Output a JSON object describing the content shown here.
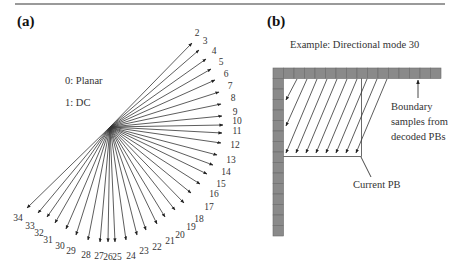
{
  "panel_a": {
    "label": "(a)",
    "legend": [
      "0: Planar",
      "1: DC"
    ],
    "center": [
      110,
      127
    ],
    "modes": [
      {
        "id": "2",
        "end": [
          192,
          43
        ],
        "lab": [
          197,
          34
        ]
      },
      {
        "id": "3",
        "end": [
          199,
          50
        ],
        "lab": [
          205,
          42
        ]
      },
      {
        "id": "4",
        "end": [
          206,
          59
        ],
        "lab": [
          214,
          52
        ]
      },
      {
        "id": "5",
        "end": [
          211,
          69
        ],
        "lab": [
          221,
          63
        ]
      },
      {
        "id": "6",
        "end": [
          215,
          80
        ],
        "lab": [
          226,
          75
        ]
      },
      {
        "id": "7",
        "end": [
          219,
          92
        ],
        "lab": [
          230,
          87
        ]
      },
      {
        "id": "8",
        "end": [
          221,
          104
        ],
        "lab": [
          233,
          99
        ]
      },
      {
        "id": "9",
        "end": [
          222,
          116
        ],
        "lab": [
          235,
          113
        ]
      },
      {
        "id": "10",
        "end": [
          223,
          125
        ],
        "lab": [
          237,
          122
        ]
      },
      {
        "id": "11",
        "end": [
          222,
          133
        ],
        "lab": [
          237,
          132
        ]
      },
      {
        "id": "12",
        "end": [
          221,
          143
        ],
        "lab": [
          235,
          146
        ]
      },
      {
        "id": "13",
        "end": [
          217,
          155
        ],
        "lab": [
          231,
          161
        ]
      },
      {
        "id": "14",
        "end": [
          213,
          165
        ],
        "lab": [
          226,
          173
        ]
      },
      {
        "id": "15",
        "end": [
          207,
          174
        ],
        "lab": [
          221,
          185
        ]
      },
      {
        "id": "16",
        "end": [
          200,
          184
        ],
        "lab": [
          214,
          195
        ]
      },
      {
        "id": "17",
        "end": [
          191,
          193
        ],
        "lab": [
          209,
          208
        ]
      },
      {
        "id": "18",
        "end": [
          184,
          203
        ],
        "lab": [
          199,
          220
        ]
      },
      {
        "id": "19",
        "end": [
          175,
          210
        ],
        "lab": [
          191,
          228
        ]
      },
      {
        "id": "20",
        "end": [
          165,
          217
        ],
        "lab": [
          180,
          236
        ]
      },
      {
        "id": "21",
        "end": [
          157,
          224
        ],
        "lab": [
          170,
          242
        ]
      },
      {
        "id": "22",
        "end": [
          146,
          230
        ],
        "lab": [
          157,
          248
        ]
      },
      {
        "id": "23",
        "end": [
          137,
          235
        ],
        "lab": [
          144,
          252
        ]
      },
      {
        "id": "24",
        "end": [
          126,
          240
        ],
        "lab": [
          131,
          257
        ]
      },
      {
        "id": "25",
        "end": [
          115,
          242
        ],
        "lab": [
          117,
          258
        ]
      },
      {
        "id": "26",
        "end": [
          108,
          242
        ],
        "lab": [
          108,
          258
        ]
      },
      {
        "id": "27",
        "end": [
          100,
          242
        ],
        "lab": [
          99,
          257
        ]
      },
      {
        "id": "28",
        "end": [
          88,
          240
        ],
        "lab": [
          86,
          256
        ]
      },
      {
        "id": "29",
        "end": [
          76,
          235
        ],
        "lab": [
          71,
          252
        ]
      },
      {
        "id": "30",
        "end": [
          66,
          229
        ],
        "lab": [
          60,
          247
        ]
      },
      {
        "id": "31",
        "end": [
          55,
          223
        ],
        "lab": [
          48,
          241
        ]
      },
      {
        "id": "32",
        "end": [
          47,
          217
        ],
        "lab": [
          39,
          234
        ]
      },
      {
        "id": "33",
        "end": [
          38,
          213
        ],
        "lab": [
          30,
          227
        ]
      },
      {
        "id": "34",
        "end": [
          27,
          208
        ],
        "lab": [
          18,
          219
        ]
      }
    ]
  },
  "panel_b": {
    "label": "(b)",
    "title": "Example: Directional mode 30",
    "boundary_note": "Boundary\nsamples from\ndecoded PBs",
    "current_pb_label": "Current PB",
    "cell_color": "#8a8a8a",
    "cell_border": "#6a6a6a",
    "top_row": {
      "x": 273,
      "y": 68,
      "cells": 16,
      "size": 10.5
    },
    "left_col": {
      "x": 273,
      "y": 78.5,
      "cells": 15,
      "size": 10.5
    },
    "pb_box": {
      "x": 283.5,
      "y": 78.5,
      "w": 78,
      "h": 78
    },
    "pred_arrows": [
      {
        "from": [
          297,
          79
        ],
        "to": [
          286,
          100
        ]
      },
      {
        "from": [
          307,
          79
        ],
        "to": [
          286,
          126
        ]
      },
      {
        "from": [
          317,
          79
        ],
        "to": [
          286,
          153
        ]
      },
      {
        "from": [
          327,
          79
        ],
        "to": [
          296,
          153
        ]
      },
      {
        "from": [
          337,
          79
        ],
        "to": [
          306,
          153
        ]
      },
      {
        "from": [
          347,
          79
        ],
        "to": [
          316,
          153
        ]
      },
      {
        "from": [
          357,
          79
        ],
        "to": [
          326,
          153
        ]
      },
      {
        "from": [
          367,
          79
        ],
        "to": [
          336,
          153
        ]
      },
      {
        "from": [
          377,
          79
        ],
        "to": [
          346,
          153
        ]
      },
      {
        "from": [
          387,
          79
        ],
        "to": [
          356,
          153
        ]
      }
    ],
    "boundary_pointer": {
      "from": [
        418,
        98
      ],
      "to": [
        418,
        80
      ]
    },
    "pb_pointer": {
      "from": [
        371,
        177
      ],
      "to": [
        361,
        157
      ]
    }
  }
}
